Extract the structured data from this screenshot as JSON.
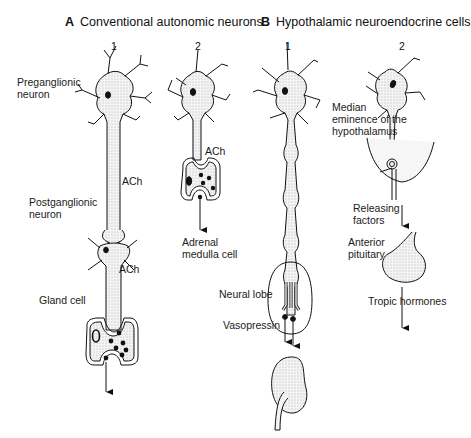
{
  "panels": {
    "A": {
      "letter": "A",
      "title": "Conventional autonomic neurons",
      "columns": [
        "1",
        "2"
      ],
      "labels": {
        "preganglionic_1": "Preganglionic",
        "preganglionic_2": "neuron",
        "ach_1": "ACh",
        "postganglionic_1": "Postganglionic",
        "postganglionic_2": "neuron",
        "ach_2": "ACh",
        "gland_cell": "Gland cell",
        "ach_3": "ACh",
        "adrenal_1": "Adrenal",
        "adrenal_2": "medulla cell"
      }
    },
    "B": {
      "letter": "B",
      "title": "Hypothalamic neuroendocrine cells",
      "columns": [
        "1",
        "2"
      ],
      "labels": {
        "neural_lobe": "Neural lobe",
        "vasopressin": "Vasopressin",
        "median_1": "Median",
        "median_2": "eminence of the",
        "median_3": "hypothalamus",
        "releasing_1": "Releasing",
        "releasing_2": "factors",
        "anterior_1": "Anterior",
        "anterior_2": "pituitary",
        "tropic": "Tropic hormones"
      }
    }
  },
  "colors": {
    "ink": "#111111",
    "stipple": "#e9e9e9",
    "background": "#ffffff"
  }
}
